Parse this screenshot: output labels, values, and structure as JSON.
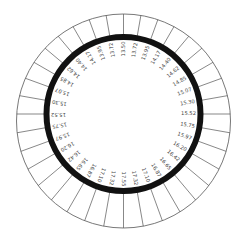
{
  "diagram": {
    "type": "circular-dial",
    "colors": {
      "background": "#ffffff",
      "outer_line": "#555555",
      "thick_ring": "#111111",
      "label": "#444444"
    },
    "geometry": {
      "outer_center": [
        123.5,
        121
      ],
      "outer_radius": 107,
      "ring_center": [
        123.5,
        114
      ],
      "ring_radius": 77,
      "ring_width": 6,
      "label_radius": 65,
      "segment_count": 36
    },
    "labels": [
      "13.50",
      "13.72",
      "13.95",
      "14.17",
      "14.40",
      "14.62",
      "14.85",
      "15.07",
      "15.30",
      "15.52",
      "15.75",
      "15.97",
      "16.20",
      "16.42",
      "16.65",
      "16.87",
      "17.10",
      "17.32",
      "17.55",
      "17.32",
      "17.10",
      "16.87",
      "16.65",
      "16.42",
      "16.20",
      "15.97",
      "15.75",
      "15.52",
      "15.30",
      "15.07",
      "14.85",
      "14.62",
      "14.40",
      "14.17",
      "13.95",
      "13.72"
    ]
  }
}
